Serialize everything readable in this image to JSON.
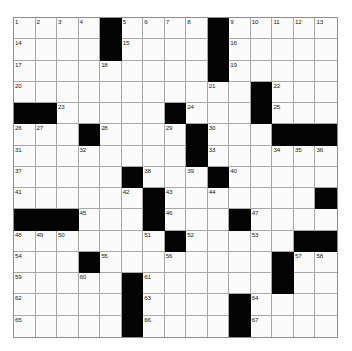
{
  "puzzle": {
    "kind": "crossword-grid",
    "rows": 15,
    "cols": 15,
    "colors": {
      "block": "#040404",
      "cell": "#fbfbfb",
      "grid_line": "#a8a8a8",
      "border": "#8d8d8d",
      "number_text": "#1a1a1a",
      "page_background": "#ffffff"
    },
    "blocks": [
      [
        0,
        4
      ],
      [
        0,
        9
      ],
      [
        1,
        4
      ],
      [
        1,
        9
      ],
      [
        2,
        9
      ],
      [
        3,
        11
      ],
      [
        4,
        0
      ],
      [
        4,
        1
      ],
      [
        4,
        7
      ],
      [
        4,
        11
      ],
      [
        5,
        3
      ],
      [
        5,
        8
      ],
      [
        5,
        12
      ],
      [
        5,
        13
      ],
      [
        5,
        14
      ],
      [
        6,
        8
      ],
      [
        7,
        5
      ],
      [
        7,
        9
      ],
      [
        8,
        6
      ],
      [
        8,
        14
      ],
      [
        9,
        0
      ],
      [
        9,
        1
      ],
      [
        9,
        2
      ],
      [
        9,
        6
      ],
      [
        9,
        10
      ],
      [
        10,
        7
      ],
      [
        10,
        13
      ],
      [
        10,
        14
      ],
      [
        11,
        3
      ],
      [
        11,
        12
      ],
      [
        12,
        5
      ],
      [
        12,
        12
      ],
      [
        13,
        5
      ],
      [
        13,
        10
      ],
      [
        14,
        5
      ],
      [
        14,
        10
      ]
    ],
    "numbers": [
      {
        "row": 0,
        "col": 0,
        "n": "1"
      },
      {
        "row": 0,
        "col": 1,
        "n": "2"
      },
      {
        "row": 0,
        "col": 2,
        "n": "3"
      },
      {
        "row": 0,
        "col": 3,
        "n": "4"
      },
      {
        "row": 0,
        "col": 5,
        "n": "5"
      },
      {
        "row": 0,
        "col": 6,
        "n": "6"
      },
      {
        "row": 0,
        "col": 7,
        "n": "7"
      },
      {
        "row": 0,
        "col": 8,
        "n": "8"
      },
      {
        "row": 0,
        "col": 10,
        "n": "9"
      },
      {
        "row": 0,
        "col": 11,
        "n": "10"
      },
      {
        "row": 0,
        "col": 12,
        "n": "11"
      },
      {
        "row": 0,
        "col": 13,
        "n": "12"
      },
      {
        "row": 0,
        "col": 14,
        "n": "13"
      },
      {
        "row": 1,
        "col": 0,
        "n": "14"
      },
      {
        "row": 1,
        "col": 5,
        "n": "15"
      },
      {
        "row": 1,
        "col": 10,
        "n": "16"
      },
      {
        "row": 2,
        "col": 0,
        "n": "17"
      },
      {
        "row": 2,
        "col": 4,
        "n": "18"
      },
      {
        "row": 2,
        "col": 10,
        "n": "19"
      },
      {
        "row": 3,
        "col": 0,
        "n": "20"
      },
      {
        "row": 3,
        "col": 9,
        "n": "21"
      },
      {
        "row": 3,
        "col": 12,
        "n": "22"
      },
      {
        "row": 4,
        "col": 2,
        "n": "23"
      },
      {
        "row": 4,
        "col": 8,
        "n": "24"
      },
      {
        "row": 4,
        "col": 12,
        "n": "25"
      },
      {
        "row": 5,
        "col": 0,
        "n": "26"
      },
      {
        "row": 5,
        "col": 1,
        "n": "27"
      },
      {
        "row": 5,
        "col": 4,
        "n": "28"
      },
      {
        "row": 5,
        "col": 7,
        "n": "29"
      },
      {
        "row": 5,
        "col": 9,
        "n": "30"
      },
      {
        "row": 6,
        "col": 0,
        "n": "31"
      },
      {
        "row": 6,
        "col": 3,
        "n": "32"
      },
      {
        "row": 6,
        "col": 9,
        "n": "33"
      },
      {
        "row": 6,
        "col": 12,
        "n": "34"
      },
      {
        "row": 6,
        "col": 13,
        "n": "35"
      },
      {
        "row": 6,
        "col": 14,
        "n": "36"
      },
      {
        "row": 7,
        "col": 0,
        "n": "37"
      },
      {
        "row": 7,
        "col": 6,
        "n": "38"
      },
      {
        "row": 7,
        "col": 8,
        "n": "39"
      },
      {
        "row": 7,
        "col": 10,
        "n": "40"
      },
      {
        "row": 8,
        "col": 0,
        "n": "41"
      },
      {
        "row": 8,
        "col": 5,
        "n": "42"
      },
      {
        "row": 8,
        "col": 7,
        "n": "43"
      },
      {
        "row": 8,
        "col": 9,
        "n": "44"
      },
      {
        "row": 9,
        "col": 3,
        "n": "45"
      },
      {
        "row": 9,
        "col": 7,
        "n": "46"
      },
      {
        "row": 9,
        "col": 11,
        "n": "47"
      },
      {
        "row": 10,
        "col": 0,
        "n": "48"
      },
      {
        "row": 10,
        "col": 1,
        "n": "49"
      },
      {
        "row": 10,
        "col": 2,
        "n": "50"
      },
      {
        "row": 10,
        "col": 6,
        "n": "51"
      },
      {
        "row": 10,
        "col": 8,
        "n": "52"
      },
      {
        "row": 10,
        "col": 11,
        "n": "53"
      },
      {
        "row": 11,
        "col": 0,
        "n": "54"
      },
      {
        "row": 11,
        "col": 4,
        "n": "55"
      },
      {
        "row": 11,
        "col": 7,
        "n": "56"
      },
      {
        "row": 11,
        "col": 13,
        "n": "57"
      },
      {
        "row": 11,
        "col": 14,
        "n": "58"
      },
      {
        "row": 12,
        "col": 0,
        "n": "59"
      },
      {
        "row": 12,
        "col": 3,
        "n": "60"
      },
      {
        "row": 12,
        "col": 6,
        "n": "61"
      },
      {
        "row": 13,
        "col": 0,
        "n": "62"
      },
      {
        "row": 13,
        "col": 6,
        "n": "63"
      },
      {
        "row": 13,
        "col": 11,
        "n": "64"
      },
      {
        "row": 14,
        "col": 0,
        "n": "65"
      },
      {
        "row": 14,
        "col": 6,
        "n": "66"
      },
      {
        "row": 14,
        "col": 11,
        "n": "67"
      }
    ]
  }
}
